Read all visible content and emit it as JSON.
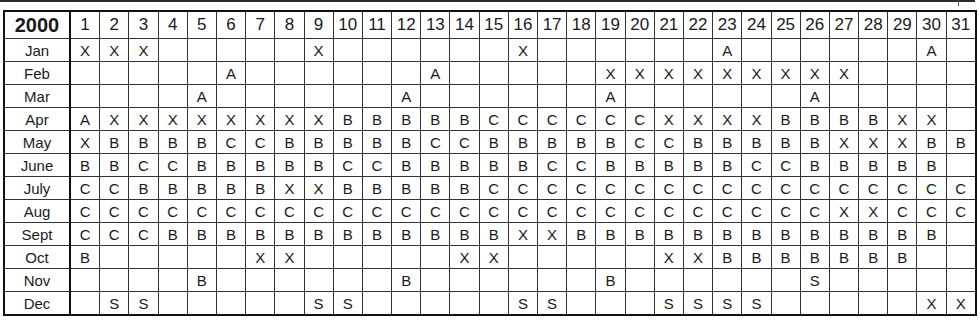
{
  "table": {
    "year": "2000",
    "days": [
      "1",
      "2",
      "3",
      "4",
      "5",
      "6",
      "7",
      "8",
      "9",
      "10",
      "11",
      "12",
      "13",
      "14",
      "15",
      "16",
      "17",
      "18",
      "19",
      "20",
      "21",
      "22",
      "23",
      "24",
      "25",
      "26",
      "27",
      "28",
      "29",
      "30",
      "31"
    ],
    "rows": [
      {
        "month": "Jan",
        "cells": [
          "X",
          "X",
          "X",
          "",
          "",
          "",
          "",
          "",
          "X",
          "",
          "",
          "",
          "",
          "",
          "",
          "X",
          "",
          "",
          "",
          "",
          "",
          "",
          "A",
          "",
          "",
          "",
          "",
          "",
          "",
          "A",
          ""
        ]
      },
      {
        "month": "Feb",
        "cells": [
          "",
          "",
          "",
          "",
          "",
          "A",
          "",
          "",
          "",
          "",
          "",
          "",
          "A",
          "",
          "",
          "",
          "",
          "",
          "X",
          "X",
          "X",
          "X",
          "X",
          "X",
          "X",
          "X",
          "X",
          "",
          "",
          "",
          ""
        ]
      },
      {
        "month": "Mar",
        "cells": [
          "",
          "",
          "",
          "",
          "A",
          "",
          "",
          "",
          "",
          "",
          "",
          "A",
          "",
          "",
          "",
          "",
          "",
          "",
          "A",
          "",
          "",
          "",
          "",
          "",
          "",
          "A",
          "",
          "",
          "",
          "",
          ""
        ]
      },
      {
        "month": "Apr",
        "cells": [
          "A",
          "X",
          "X",
          "X",
          "X",
          "X",
          "X",
          "X",
          "X",
          "B",
          "B",
          "B",
          "B",
          "B",
          "C",
          "C",
          "C",
          "C",
          "C",
          "C",
          "X",
          "X",
          "X",
          "X",
          "B",
          "B",
          "B",
          "B",
          "X",
          "X",
          ""
        ]
      },
      {
        "month": "May",
        "cells": [
          "X",
          "B",
          "B",
          "B",
          "B",
          "C",
          "C",
          "B",
          "B",
          "B",
          "B",
          "B",
          "C",
          "C",
          "B",
          "B",
          "B",
          "B",
          "B",
          "C",
          "C",
          "B",
          "B",
          "B",
          "B",
          "B",
          "X",
          "X",
          "X",
          "B",
          "B"
        ]
      },
      {
        "month": "June",
        "cells": [
          "B",
          "B",
          "C",
          "C",
          "B",
          "B",
          "B",
          "B",
          "B",
          "C",
          "C",
          "B",
          "B",
          "B",
          "B",
          "B",
          "C",
          "C",
          "B",
          "B",
          "B",
          "B",
          "B",
          "C",
          "C",
          "B",
          "B",
          "B",
          "B",
          "B",
          ""
        ]
      },
      {
        "month": "July",
        "cells": [
          "C",
          "C",
          "B",
          "B",
          "B",
          "B",
          "B",
          "X",
          "X",
          "B",
          "B",
          "B",
          "B",
          "B",
          "C",
          "C",
          "C",
          "C",
          "C",
          "C",
          "C",
          "C",
          "C",
          "C",
          "C",
          "C",
          "C",
          "C",
          "C",
          "C",
          "C"
        ]
      },
      {
        "month": "Aug",
        "cells": [
          "C",
          "C",
          "C",
          "C",
          "C",
          "C",
          "C",
          "C",
          "C",
          "C",
          "C",
          "C",
          "C",
          "C",
          "C",
          "C",
          "C",
          "C",
          "C",
          "C",
          "C",
          "C",
          "C",
          "C",
          "C",
          "C",
          "X",
          "X",
          "C",
          "C",
          "C"
        ]
      },
      {
        "month": "Sept",
        "cells": [
          "C",
          "C",
          "C",
          "B",
          "B",
          "B",
          "B",
          "B",
          "B",
          "B",
          "B",
          "B",
          "B",
          "B",
          "B",
          "X",
          "X",
          "B",
          "B",
          "B",
          "B",
          "B",
          "B",
          "B",
          "B",
          "B",
          "B",
          "B",
          "B",
          "B",
          ""
        ]
      },
      {
        "month": "Oct",
        "cells": [
          "B",
          "",
          "",
          "",
          "",
          "",
          "X",
          "X",
          "",
          "",
          "",
          "",
          "",
          "X",
          "X",
          "",
          "",
          "",
          "",
          "",
          "X",
          "X",
          "B",
          "B",
          "B",
          "B",
          "B",
          "B",
          "B",
          "",
          ""
        ]
      },
      {
        "month": "Nov",
        "cells": [
          "",
          "",
          "",
          "",
          "B",
          "",
          "",
          "",
          "",
          "",
          "",
          "B",
          "",
          "",
          "",
          "",
          "",
          "",
          "B",
          "",
          "",
          "",
          "",
          "",
          "",
          "S",
          "",
          "",
          "",
          "",
          ""
        ]
      },
      {
        "month": "Dec",
        "cells": [
          "",
          "S",
          "S",
          "",
          "",
          "",
          "",
          "",
          "S",
          "S",
          "",
          "",
          "",
          "",
          "",
          "S",
          "S",
          "",
          "",
          "",
          "S",
          "S",
          "S",
          "S",
          "",
          "",
          "",
          "",
          "",
          "X",
          "X"
        ]
      }
    ]
  }
}
